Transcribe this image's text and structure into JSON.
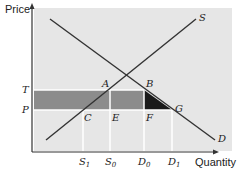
{
  "diagram": {
    "y_axis_label": "Price",
    "x_axis_label": "Quantity",
    "curves": {
      "supply": "S",
      "demand": "D"
    },
    "price_labels": {
      "T": "T",
      "P": "P"
    },
    "points": {
      "A": "A",
      "B": "B",
      "C": "C",
      "E": "E",
      "F": "F",
      "G": "G"
    },
    "quantity_ticks": [
      {
        "base": "S",
        "sub": "1"
      },
      {
        "base": "S",
        "sub": "0"
      },
      {
        "base": "D",
        "sub": "0"
      },
      {
        "base": "D",
        "sub": "1"
      }
    ],
    "colors": {
      "background_panel": "#e6e6e6",
      "tariff_band": "#8c8c8c",
      "deadweight_triangle": "#1a1a1a",
      "gridline": "#ffffff",
      "curve": "#333333"
    }
  }
}
